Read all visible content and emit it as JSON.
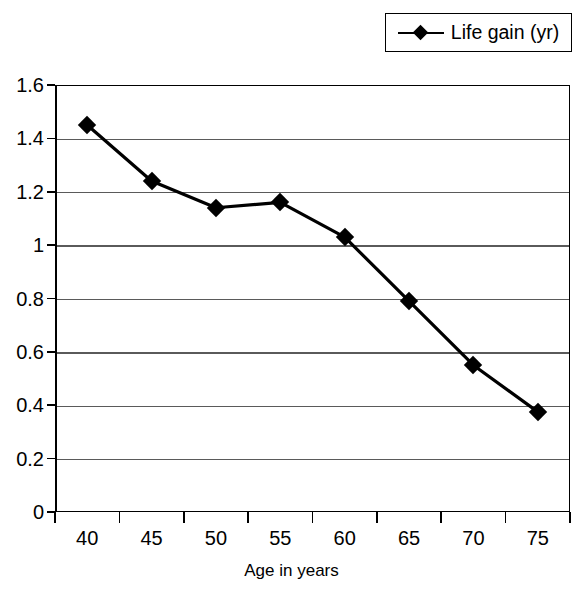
{
  "chart_data": {
    "type": "line",
    "title": "",
    "subtitle": "",
    "xlabel": "Age in years",
    "ylabel": "",
    "categories": [
      "40",
      "45",
      "50",
      "55",
      "60",
      "65",
      "70",
      "75"
    ],
    "x": [
      40,
      45,
      50,
      55,
      60,
      65,
      70,
      75
    ],
    "series": [
      {
        "name": "Life gain (yr)",
        "values": [
          1.45,
          1.24,
          1.14,
          1.16,
          1.03,
          0.79,
          0.55,
          0.375
        ],
        "marker": "diamond",
        "color": "#000000"
      }
    ],
    "ylim": [
      0,
      1.6
    ],
    "ytick_values": [
      0,
      0.2,
      0.4,
      0.6,
      0.8,
      1,
      1.2,
      1.4,
      1.6
    ],
    "ytick_labels": [
      "0",
      "0.2",
      "0.4",
      "0.6",
      "0.8",
      "1",
      "1.2",
      "1.4",
      "1.6"
    ],
    "grid": "horizontal",
    "legend_position": "top-right",
    "legend_entries": [
      "Life gain (yr)"
    ],
    "annotations": []
  },
  "legend": {
    "entry_label": "Life gain (yr)"
  },
  "axes": {
    "x_title": "Age in years"
  },
  "colors": {
    "series": "#000000",
    "gridline": "#5a5a5a",
    "frame": "#000000",
    "background": "#ffffff"
  }
}
